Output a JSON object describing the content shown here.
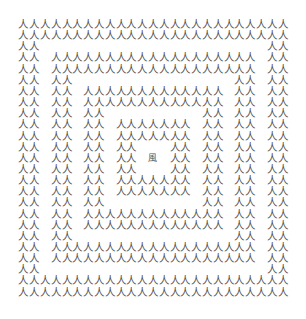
{
  "puzzle": {
    "rows": 25,
    "cols": 25,
    "base_char": "人",
    "odd_char": "風",
    "odd_position": {
      "row": 12,
      "col": 12
    },
    "rings": [
      {
        "top": 0,
        "left": 0,
        "bottom": 24,
        "right": 24,
        "thickness": 2
      },
      {
        "top": 3,
        "left": 3,
        "bottom": 21,
        "right": 21,
        "thickness": 2
      },
      {
        "top": 6,
        "left": 6,
        "bottom": 18,
        "right": 18,
        "thickness": 2
      },
      {
        "top": 9,
        "left": 9,
        "bottom": 15,
        "right": 15,
        "thickness": 2
      }
    ],
    "text_color": "#555555",
    "background_color": "#ffffff"
  }
}
